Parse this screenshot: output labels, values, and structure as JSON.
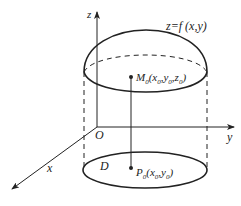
{
  "diagram": {
    "type": "3d-surface-projection",
    "labels": {
      "z_axis": "z",
      "y_axis": "y",
      "x_axis": "x",
      "origin": "O",
      "surface": "z=f (x,y)",
      "region": "D",
      "point_M": "M",
      "point_M_sub": "0",
      "point_M_coords": "(x",
      "point_M_x_sub": "0",
      "point_M_comma1": ",y",
      "point_M_y_sub": "0",
      "point_M_comma2": ",z",
      "point_M_z_sub": "0",
      "point_M_close": ")",
      "point_P": "P",
      "point_P_sub": "0",
      "point_P_coords": "(x",
      "point_P_x_sub": "0",
      "point_P_comma": ",y",
      "point_P_y_sub": "0",
      "point_P_close": ")"
    },
    "colors": {
      "stroke": "#222222",
      "background": "#ffffff"
    }
  }
}
